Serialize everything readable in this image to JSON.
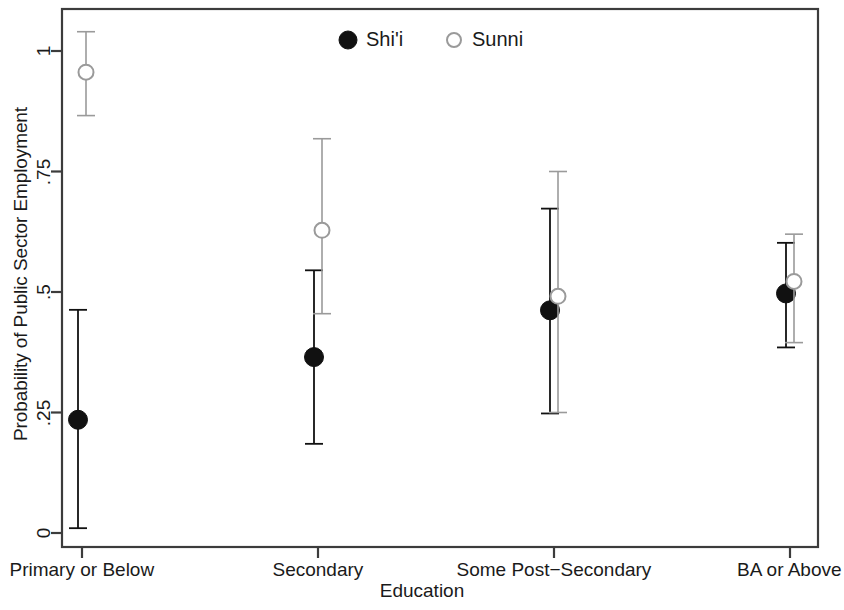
{
  "chart_data": {
    "type": "scatter",
    "title": "",
    "xlabel": "Education",
    "ylabel": "Probability of Public Sector Employment",
    "categories": [
      "Primary or Below",
      "Secondary",
      "Some Post−Secondary",
      "BA or Above"
    ],
    "ylim": [
      0,
      1.06
    ],
    "yticks": [
      0,
      0.25,
      0.5,
      0.75,
      1
    ],
    "ytick_labels": [
      "0",
      ".25",
      ".5",
      ".75",
      "1"
    ],
    "grid": false,
    "legend_position": "top-center",
    "series": [
      {
        "name": "Shi'i",
        "marker": "filled-circle",
        "color": "#111111",
        "values": [
          0.235,
          0.365,
          0.462,
          0.497
        ],
        "ci_low": [
          0.01,
          0.185,
          0.248,
          0.385
        ],
        "ci_high": [
          0.463,
          0.545,
          0.673,
          0.602
        ]
      },
      {
        "name": "Sunni",
        "marker": "open-circle",
        "color": "#9a9a9a",
        "values": [
          0.956,
          0.628,
          0.491,
          0.522
        ],
        "ci_low": [
          0.866,
          0.455,
          0.25,
          0.395
        ],
        "ci_high": [
          1.04,
          0.818,
          0.75,
          0.62
        ]
      }
    ]
  },
  "legend": {
    "items": [
      {
        "label": "Shi'i",
        "marker": "filled-circle"
      },
      {
        "label": "Sunni",
        "marker": "open-circle"
      }
    ]
  },
  "axes": {
    "y_title": "Probability of Public Sector Employment",
    "x_title": "Education",
    "y_tick_labels": [
      "1",
      ".75",
      ".5",
      ".25",
      "0"
    ],
    "x_tick_labels": [
      "Primary or Below",
      "Secondary",
      "Some Post−Secondary",
      "BA or Above"
    ]
  }
}
